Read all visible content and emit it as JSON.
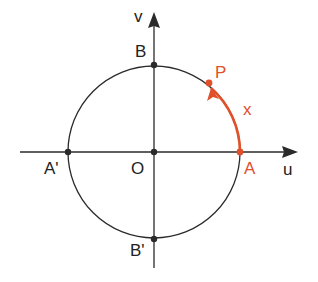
{
  "diagram": {
    "axes": {
      "horizontal": "u",
      "vertical": "v"
    },
    "points": {
      "origin": "O",
      "right": "A",
      "left": "A'",
      "top": "B",
      "bottom": "B'",
      "moving": "P"
    },
    "arc_label": "x",
    "colors": {
      "line": "#2a2a2a",
      "accent": "#e0502a"
    }
  }
}
